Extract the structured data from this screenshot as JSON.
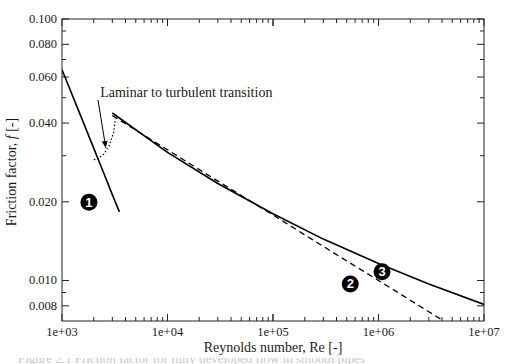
{
  "chart_data": {
    "type": "line",
    "title": "",
    "xlabel": "Reynolds number, Re [-]",
    "ylabel": "Friction factor, f [-]",
    "ylabel_parts": {
      "prefix": "Friction factor, ",
      "italic": "f",
      "suffix": " [-]"
    },
    "xscale": "log",
    "yscale": "log",
    "xlim": [
      1000,
      10000000
    ],
    "ylim": [
      0.007,
      0.1
    ],
    "grid": false,
    "x_ticks": [
      1000,
      10000,
      100000,
      1000000,
      10000000
    ],
    "x_tick_labels": [
      "1e+03",
      "1e+04",
      "1e+05",
      "1e+06",
      "1e+07"
    ],
    "y_ticks": [
      0.008,
      0.01,
      0.02,
      0.04,
      0.06,
      0.08,
      0.1
    ],
    "y_tick_labels": [
      "0.008",
      "0.010",
      "0.020",
      "0.040",
      "0.060",
      "0.080",
      "0.100"
    ],
    "series": [
      {
        "name": "1",
        "label": "Laminar (64/Re)",
        "style": "solid",
        "color": "#000000",
        "x": [
          1000,
          1500,
          2000,
          2500,
          3000,
          3500
        ],
        "y": [
          0.064,
          0.0427,
          0.032,
          0.0256,
          0.0213,
          0.0183
        ]
      },
      {
        "name": "2",
        "label": "Blasius (dashed)",
        "style": "dashed",
        "color": "#000000",
        "x": [
          3000,
          10000,
          30000,
          100000,
          300000,
          1000000,
          3000000,
          4160000
        ],
        "y": [
          0.0427,
          0.0316,
          0.024,
          0.0178,
          0.0135,
          0.01,
          0.0076,
          0.007
        ]
      },
      {
        "name": "3",
        "label": "Turbulent smooth pipe (solid)",
        "style": "solid",
        "color": "#000000",
        "x": [
          3000,
          10000,
          30000,
          100000,
          300000,
          1000000,
          3000000,
          10000000
        ],
        "y": [
          0.0437,
          0.0309,
          0.0235,
          0.018,
          0.0144,
          0.0116,
          0.0097,
          0.0081
        ]
      }
    ],
    "transition": {
      "style": "dotted",
      "x": [
        2000,
        2200,
        2500,
        2800,
        3100,
        3200
      ],
      "y": [
        0.029,
        0.0292,
        0.0305,
        0.0328,
        0.037,
        0.0415
      ]
    },
    "annotations": [
      {
        "text": "Laminar to turbulent transition",
        "x": 2300,
        "y": 0.0505,
        "arrow_to": {
          "x": 2600,
          "y": 0.0305
        }
      }
    ],
    "badges": [
      {
        "label": "1",
        "x": 1800,
        "y": 0.0199
      },
      {
        "label": "2",
        "x": 540000,
        "y": 0.0097
      },
      {
        "label": "3",
        "x": 1080000,
        "y": 0.0108
      }
    ]
  },
  "caption_fragment": "Figure 2.1 Friction factor for fully developed flow in smooth pipes"
}
